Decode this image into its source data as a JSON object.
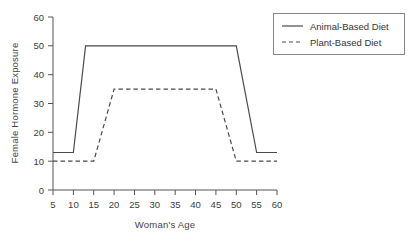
{
  "chart_data": {
    "type": "line",
    "title": "",
    "xlabel": "Woman's Age",
    "ylabel": "Female Hormone Exposure",
    "xlim": [
      5,
      60
    ],
    "ylim": [
      0,
      60
    ],
    "xticks": [
      5,
      10,
      15,
      20,
      25,
      30,
      35,
      40,
      45,
      50,
      55,
      60
    ],
    "yticks": [
      0,
      10,
      20,
      30,
      40,
      50,
      60
    ],
    "xtick_labels": [
      "5",
      "10",
      "15",
      "20",
      "25",
      "30",
      "35",
      "40",
      "45",
      "50",
      "55",
      "60"
    ],
    "ytick_labels": [
      "0",
      "10",
      "20",
      "30",
      "40",
      "50",
      "60"
    ],
    "grid": false,
    "legend_position": "upper right",
    "series": [
      {
        "name": "Animal-Based Diet",
        "style": "solid",
        "color": "#4a4a4a",
        "x": [
          5,
          10,
          13,
          50,
          55,
          60
        ],
        "values": [
          13,
          13,
          50,
          50,
          13,
          13
        ]
      },
      {
        "name": "Plant-Based Diet",
        "style": "dashed",
        "color": "#4a4a4a",
        "x": [
          5,
          15,
          20,
          45,
          50,
          60
        ],
        "values": [
          10,
          10,
          35,
          35,
          10,
          10
        ]
      }
    ]
  },
  "legend": {
    "items": [
      {
        "label": "Animal-Based Diet",
        "style": "solid"
      },
      {
        "label": "Plant-Based Diet",
        "style": "dashed"
      }
    ]
  },
  "axes": {
    "y_label": "Female Hormone Exposure",
    "x_label": "Woman's Age",
    "y_ticks": [
      "60",
      "50",
      "40",
      "30",
      "20",
      "10",
      "0"
    ],
    "x_ticks": [
      "5",
      "10",
      "15",
      "20",
      "25",
      "30",
      "35",
      "40",
      "45",
      "50",
      "55",
      "60"
    ]
  }
}
